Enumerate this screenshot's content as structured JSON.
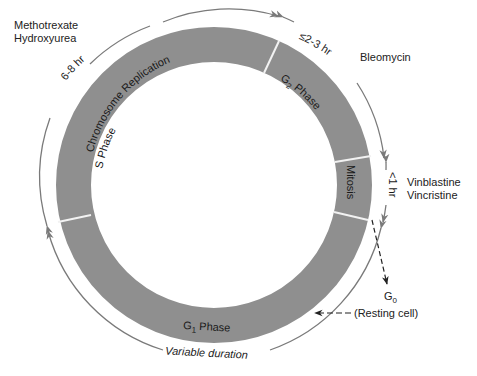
{
  "diagram": {
    "type": "cell-cycle",
    "colors": {
      "ring_fill": "#8f8f8f",
      "separator": "#f2f2f2",
      "arrow_arc": "#7a7a7a",
      "text": "#1e1e1e"
    },
    "phases": [
      {
        "name": "S Phase",
        "subtitle": "Chromosome Replication",
        "duration": "6-8 hr"
      },
      {
        "name": "G",
        "sub": "2",
        "suffix": " Phase",
        "duration": "2-3 hr"
      },
      {
        "name": "Mitosis",
        "duration": "<1 hr"
      },
      {
        "name": "G",
        "sub": "1",
        "suffix": " Phase",
        "duration": "Variable duration"
      }
    ],
    "drugs": {
      "s_phase": [
        "Methotrexate",
        "Hydroxyurea"
      ],
      "g2_phase": [
        "Bleomycin"
      ],
      "mitosis": [
        "Vinblastine",
        "Vincristine"
      ]
    },
    "resting": {
      "g0_main": "G",
      "g0_sub": "0",
      "label": "(Resting cell)"
    }
  }
}
